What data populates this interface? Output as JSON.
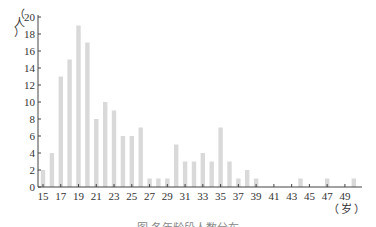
{
  "chart_data": {
    "type": "bar",
    "title": "",
    "caption": "图   各年龄段人数分布",
    "xlabel": "（岁）",
    "ylabel": "（人）",
    "ylim": [
      0,
      20
    ],
    "yticks": [
      0,
      2,
      4,
      6,
      8,
      10,
      12,
      14,
      16,
      18,
      20
    ],
    "xticks": [
      15,
      17,
      19,
      21,
      23,
      25,
      27,
      29,
      31,
      33,
      35,
      37,
      39,
      41,
      43,
      45,
      47,
      49
    ],
    "grid": false,
    "legend": null,
    "bar_color": "#d9d9d9",
    "categories": [
      15,
      16,
      17,
      18,
      19,
      20,
      21,
      22,
      23,
      24,
      25,
      26,
      27,
      28,
      29,
      30,
      31,
      32,
      33,
      34,
      35,
      36,
      37,
      38,
      39,
      40,
      41,
      42,
      43,
      44,
      45,
      46,
      47,
      48,
      49,
      50
    ],
    "values": [
      2,
      4,
      13,
      15,
      19,
      17,
      8,
      10,
      9,
      6,
      6,
      7,
      1,
      1,
      1,
      5,
      3,
      3,
      4,
      3,
      7,
      3,
      1,
      2,
      1,
      0,
      0,
      0,
      0,
      1,
      0,
      0,
      1,
      0,
      0,
      1
    ]
  },
  "labels": {
    "y_unit_chars": [
      "（",
      "人",
      "）"
    ],
    "x_unit": "（岁）",
    "caption": "图   各年龄段人数分布"
  }
}
